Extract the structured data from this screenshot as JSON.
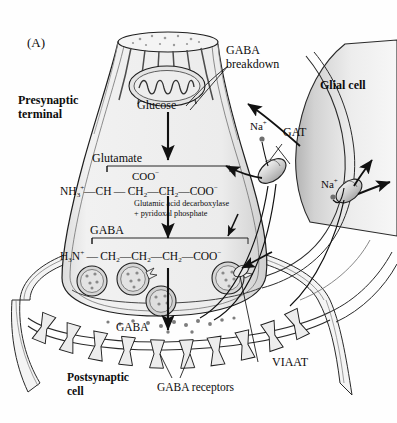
{
  "figure": {
    "panel_label": "(A)"
  },
  "labels": {
    "presynaptic_terminal": "Presynaptic\nterminal",
    "presynaptic_line1": "Presynaptic",
    "presynaptic_line2": "terminal",
    "glucose": "Glucose",
    "glutamate": "Glutamate",
    "gaba": "GABA",
    "gaba_synaptic": "GABA",
    "gaba_breakdown_line1": "GABA",
    "gaba_breakdown_line2": "breakdown",
    "glial_cell": "Glial cell",
    "gat": "GAT",
    "viaat": "VIAAT",
    "gaba_receptors": "GABA receptors",
    "postsynaptic_line1": "Postsynaptic",
    "postsynaptic_line2": "cell",
    "sodium_presyn": "Na",
    "sodium_glial": "Na",
    "sodium_charge": "+",
    "enzyme_line1": "Glutamic acid decarboxylase",
    "enzyme_line2": "+ pyridoxal phosphate"
  },
  "chemistry": {
    "glutamate": {
      "name": "Glutamate",
      "branch_group": "COO",
      "branch_charge": "−",
      "amine": "NH",
      "amine_sub": "3",
      "amine_charge": "+",
      "c1": "CH",
      "c2": "CH",
      "c2_sub": "2",
      "c3": "CH",
      "c3_sub": "2",
      "carboxyl": "COO",
      "carboxyl_charge": "−"
    },
    "gaba": {
      "name": "GABA",
      "amine": "H",
      "amine_sub": "3",
      "amine_rest": "N",
      "amine_charge": "+",
      "c1": "CH",
      "c1_sub": "2",
      "c2": "CH",
      "c2_sub": "2",
      "c3": "CH",
      "c3_sub": "2",
      "carboxyl": "COO",
      "carboxyl_charge": "−"
    }
  },
  "colors": {
    "outline": "#1a1a1a",
    "terminal_fill": "#efefef",
    "terminal_wall": "#cfcfcf",
    "glial_fill_dark": "#b9b9b9",
    "glial_fill_light": "#f2f2f2",
    "postsynaptic_fill": "#e6e6e6",
    "vesicle_fill": "#d8d8d8",
    "receptor_fill": "#e9e9e9",
    "transporter_fill": "#cdcdcd",
    "mito_fill": "#e2e2e2",
    "background": "#ffffff"
  }
}
